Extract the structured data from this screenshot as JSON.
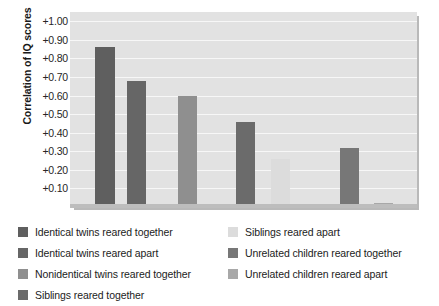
{
  "chart_data": {
    "type": "bar",
    "title": "",
    "xlabel": "",
    "ylabel": "Correlation of IQ scores",
    "ylim": [
      0.0,
      1.05
    ],
    "grid": true,
    "legend_position": "bottom",
    "ytick_labels": [
      "+1.00",
      "+0.90",
      "+0.80",
      "+0.70",
      "+0.60",
      "+0.50",
      "+0.40",
      "+0.30",
      "+0.20",
      "+0.10"
    ],
    "ytick_values": [
      1.0,
      0.9,
      0.8,
      0.7,
      0.6,
      0.5,
      0.4,
      0.3,
      0.2,
      0.1
    ],
    "categories": [
      "Identical twins reared together",
      "Identical twins reared apart",
      "Nonidentical twins reared together",
      "Siblings reared together",
      "Siblings reared apart",
      "Unrelated children reared together",
      "Unrelated children reared apart"
    ],
    "values": [
      0.86,
      0.68,
      0.6,
      0.46,
      0.26,
      0.32,
      0.02
    ],
    "colors": [
      "#5f5f5f",
      "#666666",
      "#8f8f8f",
      "#6b6b6b",
      "#dcdcdc",
      "#777777",
      "#a8a8a8"
    ],
    "bar_left_px": [
      95,
      127,
      178,
      236,
      271,
      340,
      374
    ],
    "bar_width_px": [
      20,
      19,
      19,
      19,
      19,
      19,
      19
    ],
    "plot_background": "#e2e2e2",
    "gridline_color": "#f7f7f7"
  },
  "legend": {
    "columns": [
      {
        "items": [
          {
            "label": "Identical twins reared together",
            "color": "#5f5f5f"
          },
          {
            "label": "Identical twins reared apart",
            "color": "#666666"
          },
          {
            "label": "Nonidentical twins reared together",
            "color": "#8f8f8f"
          },
          {
            "label": "Siblings reared together",
            "color": "#6b6b6b"
          }
        ]
      },
      {
        "items": [
          {
            "label": "Siblings reared apart",
            "color": "#dcdcdc"
          },
          {
            "label": "Unrelated children reared together",
            "color": "#777777"
          },
          {
            "label": "Unrelated children reared apart",
            "color": "#a8a8a8"
          }
        ]
      }
    ]
  }
}
